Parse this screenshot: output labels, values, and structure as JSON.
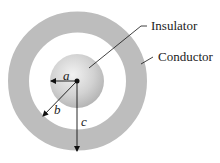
{
  "diagram": {
    "labels": {
      "insulator": "Insulator",
      "conductor": "Conductor"
    },
    "radii": {
      "a": "a",
      "b": "b",
      "c": "c"
    },
    "colors": {
      "shell": "#bdbdbd",
      "sphere_light": "#eeeeee",
      "sphere_dark": "#b5b5b5",
      "line": "#111111"
    }
  }
}
